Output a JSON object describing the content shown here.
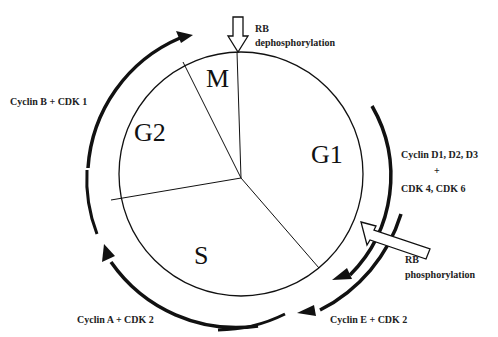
{
  "diagram": {
    "phases": [
      {
        "id": "M",
        "label": "M"
      },
      {
        "id": "G1",
        "label": "G1"
      },
      {
        "id": "S",
        "label": "S"
      },
      {
        "id": "G2",
        "label": "G2"
      }
    ],
    "annotations": {
      "rb_dephos_1": "RB",
      "rb_dephos_2": "dephosphorylation",
      "rb_phos_1": "RB",
      "rb_phos_2": "phosphorylation",
      "cyclin_b": "Cyclin B + CDK 1",
      "cyclin_d_1": "Cyclin D1, D2, D3",
      "cyclin_d_plus": "+",
      "cyclin_d_2": "CDK 4, CDK 6",
      "cyclin_e": "Cyclin E + CDK 2",
      "cyclin_a": "Cyclin A + CDK 2"
    },
    "colors": {
      "line": "#111111",
      "background": "#ffffff"
    }
  }
}
